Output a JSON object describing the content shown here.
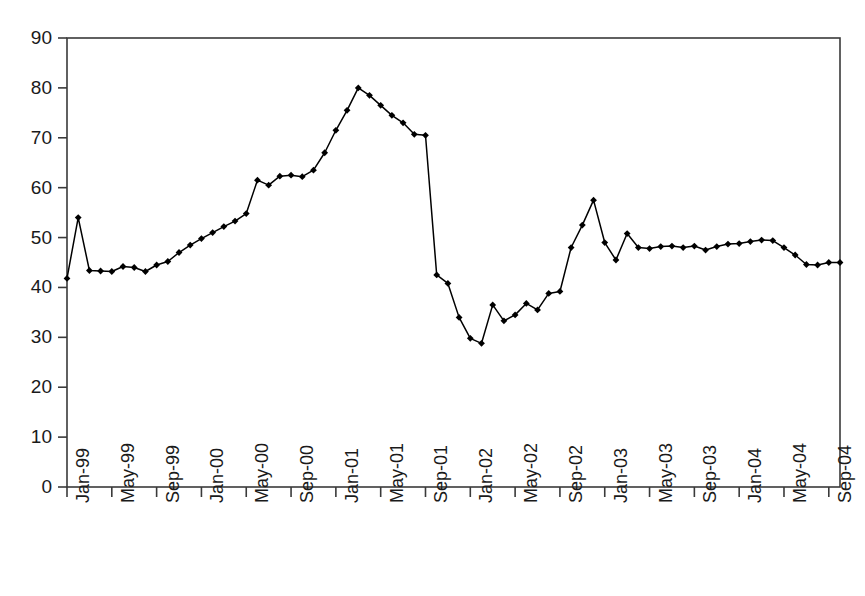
{
  "chart_data": {
    "type": "line",
    "title": "",
    "subtitle": "",
    "xlabel": "",
    "ylabel": "",
    "ylim": [
      0,
      90
    ],
    "y_ticks": [
      0,
      10,
      20,
      30,
      40,
      50,
      60,
      70,
      80,
      90
    ],
    "grid": false,
    "legend": null,
    "legend_position": "none",
    "marker": "diamond",
    "line_color": "#000000",
    "marker_color": "#000000",
    "axis_color": "#3a3a3a",
    "background_color": "#ffffff",
    "x_tick_labels": [
      "Jan-99",
      "May-99",
      "Sep-99",
      "Jan-00",
      "May-00",
      "Sep-00",
      "Jan-01",
      "May-01",
      "Sep-01",
      "Jan-02",
      "May-02",
      "Sep-02",
      "Jan-03",
      "May-03",
      "Sep-03",
      "Jan-04",
      "May-04",
      "Sep-04"
    ],
    "x_tick_interval_months": 4,
    "x_start": "Jan-99",
    "x_end": "Oct-04",
    "x": [
      "Jan-99",
      "Feb-99",
      "Mar-99",
      "Apr-99",
      "May-99",
      "Jun-99",
      "Jul-99",
      "Aug-99",
      "Sep-99",
      "Oct-99",
      "Nov-99",
      "Dec-99",
      "Jan-00",
      "Feb-00",
      "Mar-00",
      "Apr-00",
      "May-00",
      "Jun-00",
      "Jul-00",
      "Aug-00",
      "Sep-00",
      "Oct-00",
      "Nov-00",
      "Dec-00",
      "Jan-01",
      "Feb-01",
      "Mar-01",
      "Apr-01",
      "May-01",
      "Jun-01",
      "Jul-01",
      "Aug-01",
      "Sep-01",
      "Oct-01",
      "Nov-01",
      "Dec-01",
      "Jan-02",
      "Feb-02",
      "Mar-02",
      "Apr-02",
      "May-02",
      "Jun-02",
      "Jul-02",
      "Aug-02",
      "Sep-02",
      "Oct-02",
      "Nov-02",
      "Dec-02",
      "Jan-03",
      "Feb-03",
      "Mar-03",
      "Apr-03",
      "May-03",
      "Jun-03",
      "Jul-03",
      "Aug-03",
      "Sep-03",
      "Oct-03",
      "Nov-03",
      "Dec-03",
      "Jan-04",
      "Feb-04",
      "Mar-04",
      "Apr-04",
      "May-04",
      "Jun-04",
      "Jul-04",
      "Aug-04",
      "Sep-04",
      "Oct-04"
    ],
    "values": [
      41.8,
      54.0,
      43.4,
      43.3,
      43.2,
      44.2,
      44.0,
      43.2,
      44.5,
      45.2,
      47.0,
      48.5,
      49.8,
      51.0,
      52.2,
      53.3,
      54.8,
      61.5,
      60.5,
      62.3,
      62.5,
      62.2,
      63.5,
      67.0,
      71.5,
      75.5,
      80.0,
      78.5,
      76.5,
      74.5,
      73.0,
      70.7,
      70.5,
      42.5,
      40.8,
      34.0,
      29.8,
      28.8,
      36.5,
      33.3,
      34.5,
      36.8,
      35.5,
      38.8,
      39.2,
      48.0,
      52.5,
      57.5,
      49.0,
      45.5,
      50.8,
      48.0,
      47.8,
      48.2,
      48.3,
      48.0,
      48.3,
      47.5,
      48.2,
      48.7,
      48.8,
      49.2,
      49.5,
      49.4,
      48.0,
      46.5,
      44.6,
      44.5,
      45.0,
      45.0
    ]
  },
  "figure": {
    "frame_visible": true,
    "tick_direction": "out"
  }
}
